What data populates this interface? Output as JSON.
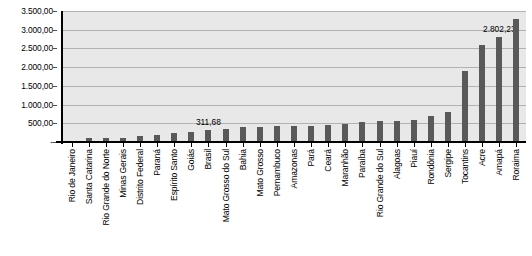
{
  "chart_data": {
    "type": "bar",
    "title": "",
    "xlabel": "",
    "ylabel": "",
    "ylim": [
      0,
      3500
    ],
    "y_ticks": [
      "-",
      "500,00",
      "1.000,00",
      "1.500,00",
      "2.000,00",
      "2.500,00",
      "3.000,00",
      "3.500,00"
    ],
    "y_tick_values": [
      0,
      500,
      1000,
      1500,
      2000,
      2500,
      3000,
      3500
    ],
    "grid": true,
    "legend": "none",
    "bar_color": "#595959",
    "plot_background": "#e8e8e8",
    "gridline_color": "#b2b2b2",
    "categories": [
      "Rio de Janeiro",
      "Santa Catarina",
      "Rio Grande do Norte",
      "Minas Gerais",
      "Distrito Federal",
      "Paraná",
      "Espírito Santo",
      "Goiás",
      "Brasil",
      "Mato Grosso do Sul",
      "Bahia",
      "Mato Grosso",
      "Pernambuco",
      "Amazonas",
      "Pará",
      "Ceará",
      "Maranhão",
      "Paraíba",
      "Rio Grande do Sul",
      "Alagoas",
      "Piauí",
      "Rondônia",
      "Sergipe",
      "Tocantins",
      "Acre",
      "Amapá",
      "Roraima"
    ],
    "values": [
      30,
      95,
      110,
      120,
      150,
      200,
      230,
      265,
      311.68,
      360,
      400,
      410,
      420,
      430,
      440,
      455,
      490,
      540,
      560,
      570,
      580,
      700,
      790,
      1900,
      2600,
      2802.23,
      3300
    ],
    "data_labels": [
      {
        "category": "Brasil",
        "index": 8,
        "text": "311,68"
      },
      {
        "category": "Amapá",
        "index": 25,
        "text": "2.802,23"
      }
    ]
  }
}
